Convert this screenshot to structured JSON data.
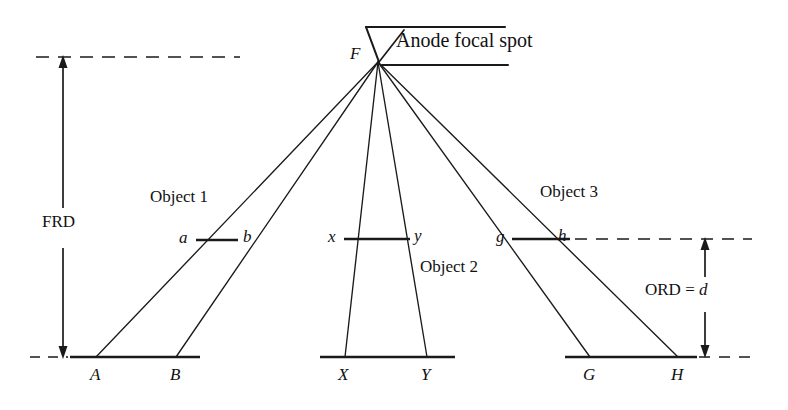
{
  "figure": {
    "background_color": "#ffffff",
    "line_color": "#1a1a1a",
    "labels": {
      "anode": "Anode focal spot",
      "focal_point": "F",
      "frd": "FRD",
      "ord": "ORD = ",
      "ord_value": "d",
      "object1": "Object 1",
      "object2": "Object 2",
      "object3": "Object 3",
      "obj1_left": "a",
      "obj1_right": "b",
      "obj2_left": "x",
      "obj2_right": "y",
      "obj3_left": "g",
      "obj3_right": "h",
      "proj1_left": "A",
      "proj1_right": "B",
      "proj2_left": "X",
      "proj2_right": "Y",
      "proj3_left": "G",
      "proj3_right": "H"
    },
    "geometry": {
      "focal_spot": {
        "x": 378,
        "y": 62
      },
      "image_plane_y": 357,
      "object_plane_left_y": 240,
      "object_plane_right_y": 239,
      "objects": [
        {
          "name": "Object 1",
          "left_x": 196,
          "right_x": 238,
          "y": 240
        },
        {
          "name": "Object 2",
          "left_x": 344,
          "right_x": 410,
          "y": 239
        },
        {
          "name": "Object 3",
          "left_x": 512,
          "right_x": 570,
          "y": 239
        }
      ],
      "projections": [
        {
          "name": "A-B",
          "left_x": 96,
          "right_x": 176,
          "y": 357,
          "line_from": 72,
          "line_to": 200
        },
        {
          "name": "X-Y",
          "left_x": 345,
          "right_x": 427,
          "y": 357,
          "line_from": 320,
          "line_to": 455
        },
        {
          "name": "G-H",
          "left_x": 590,
          "right_x": 678,
          "y": 357,
          "line_from": 565,
          "line_to": 697
        }
      ],
      "frd_arrow": {
        "x": 63,
        "y_top": 57,
        "y_bottom": 357
      },
      "ord_arrow": {
        "x": 705,
        "y_top": 239,
        "y_bottom": 357
      },
      "dashed_top_left": {
        "x1": 36,
        "x2": 240,
        "y": 57
      },
      "dashed_bottom_left": {
        "x1": 33,
        "x2": 70,
        "y": 357
      },
      "dashed_right_upper": {
        "x1": 572,
        "x2": 752,
        "y": 239
      },
      "dashed_right_lower": {
        "x1": 698,
        "x2": 752,
        "y": 357
      }
    }
  }
}
